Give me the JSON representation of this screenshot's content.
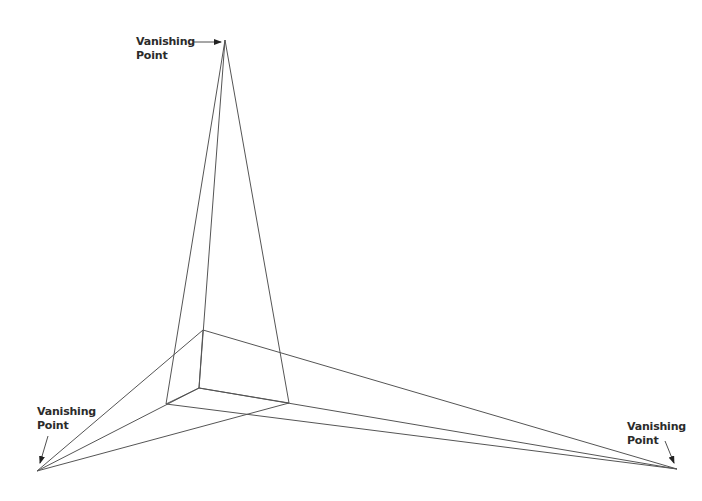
{
  "diagram": {
    "colors": {
      "line": "#555555",
      "arrow": "#222222",
      "text": "#2b2b2b",
      "background": "#ffffff"
    },
    "vanishing_points": [
      {
        "id": "top",
        "x": 225,
        "y": 40,
        "label_line1": "Vanishing",
        "label_line2": "Point"
      },
      {
        "id": "left",
        "x": 37,
        "y": 471,
        "label_line1": "Vanishing",
        "label_line2": "Point"
      },
      {
        "id": "right",
        "x": 677,
        "y": 469,
        "label_line1": "Vanishing",
        "label_line2": "Point"
      }
    ],
    "box_vertices": {
      "top_front": {
        "x": 203,
        "y": 330
      },
      "inner": {
        "x": 199,
        "y": 388
      },
      "left": {
        "x": 166,
        "y": 404
      },
      "right": {
        "x": 289,
        "y": 403
      }
    },
    "labels": {
      "top": {
        "line1": "Vanishing",
        "line2": "Point"
      },
      "left": {
        "line1": "Vanishing",
        "line2": "Point"
      },
      "right": {
        "line1": "Vanishing",
        "line2": "Point"
      }
    }
  }
}
